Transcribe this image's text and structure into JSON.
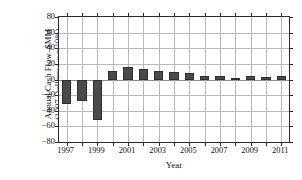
{
  "chart_data": {
    "type": "bar",
    "title": "",
    "xlabel": "Year",
    "ylabel_line1": "Annual Cash Flow–$MM",
    "ylabel_line2_pre": "(1997 Dollars; ",
    "ylabel_line2_var": "i",
    "ylabel_line2_sub": "eff",
    "ylabel_line2_post": " = 19%)",
    "categories": [
      1997,
      1998,
      1999,
      2000,
      2001,
      2002,
      2003,
      2004,
      2005,
      2006,
      2007,
      2008,
      2009,
      2010,
      2011
    ],
    "values": [
      -31,
      -28,
      -52,
      11,
      16,
      14,
      11,
      9,
      8,
      5,
      5,
      2,
      4,
      3,
      4
    ],
    "ylim": [
      -80,
      80
    ],
    "xlim": [
      1996.5,
      2011.5
    ],
    "yticks": [
      80,
      60,
      40,
      20,
      0,
      -20,
      -40,
      -60,
      -80
    ],
    "ytick_labels": [
      "80",
      "60",
      "40",
      "20",
      "0",
      "−20",
      "−40",
      "−60",
      "−80"
    ],
    "xticks": [
      1997,
      1999,
      2001,
      2003,
      2005,
      2007,
      2009,
      2011
    ],
    "xtick_labels": [
      "1997",
      "1999",
      "2001",
      "2003",
      "2005",
      "2007",
      "2009",
      "2011"
    ],
    "xminor_ticks": [
      1997,
      1998,
      1999,
      2000,
      2001,
      2002,
      2003,
      2004,
      2005,
      2006,
      2007,
      2008,
      2009,
      2010,
      2011
    ],
    "grid": true,
    "legend": null,
    "bar_color": "#4a4a4a",
    "bar_edge_color": "#2f2f2f",
    "grid_color": "#b9b9b9",
    "axis_color": "#2a2a2a"
  }
}
